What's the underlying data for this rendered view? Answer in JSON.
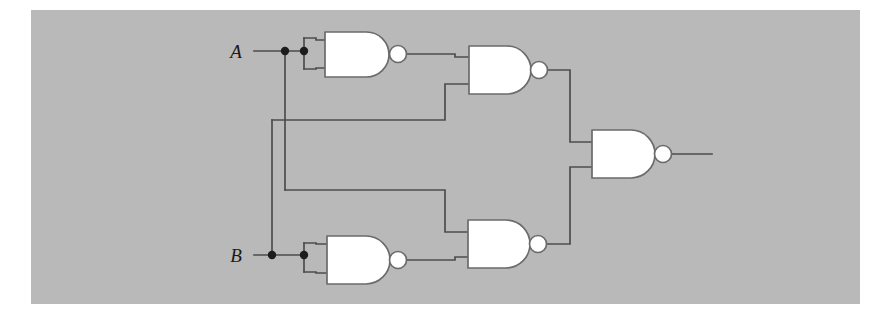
{
  "figure": {
    "kind": "logic-circuit-diagram",
    "panel": {
      "background_color": "#b9b9b9",
      "page_color": "#ffffff",
      "x": 31,
      "y": 10,
      "width": 829,
      "height": 294
    },
    "wire_color": "#4d4d4d",
    "gate_fill_color": "#ffffff",
    "gate_outline_color": "#6b6b6b",
    "junction_color": "#1d1d1d"
  },
  "inputs": [
    {
      "id": "input-a",
      "label": "A",
      "label_x": 236,
      "label_y": 58,
      "wire_y": 51
    },
    {
      "id": "input-b",
      "label": "B",
      "label_x": 236,
      "label_y": 262,
      "wire_y": 255
    }
  ],
  "outputs": [
    {
      "id": "output-wire",
      "label": "",
      "x_start": 672,
      "x_end": 712,
      "y": 154
    }
  ],
  "gates": [
    {
      "id": "gate-1",
      "type": "NAND",
      "role": "inverter-a",
      "body_x": 325,
      "body_y": 32,
      "body_w": 64,
      "body_h": 45,
      "bubble_cx": 398,
      "bubble_cy": 54,
      "bubble_r": 8.5
    },
    {
      "id": "gate-2",
      "type": "NAND",
      "role": "upper-combine",
      "body_x": 469,
      "body_y": 46,
      "body_w": 62,
      "body_h": 48,
      "bubble_cx": 539,
      "bubble_cy": 70,
      "bubble_r": 8.5
    },
    {
      "id": "gate-3",
      "type": "NAND",
      "role": "output",
      "body_x": 592,
      "body_y": 130,
      "body_w": 63,
      "body_h": 48,
      "bubble_cx": 663,
      "bubble_cy": 154,
      "bubble_r": 8.5
    },
    {
      "id": "gate-4",
      "type": "NAND",
      "role": "inverter-b",
      "body_x": 327,
      "body_y": 236,
      "body_w": 63,
      "body_h": 48,
      "bubble_cx": 398,
      "bubble_cy": 260,
      "bubble_r": 8.5
    },
    {
      "id": "gate-5",
      "type": "NAND",
      "role": "lower-combine",
      "body_x": 468,
      "body_y": 220,
      "body_w": 62,
      "body_h": 48,
      "bubble_cx": 538,
      "bubble_cy": 244,
      "bubble_r": 8.5
    }
  ],
  "junctions": [
    {
      "id": "junction-a-branch",
      "cx": 285,
      "cy": 51,
      "r": 4.2
    },
    {
      "id": "junction-a-gate-tie",
      "cx": 304,
      "cy": 51,
      "r": 4.2
    },
    {
      "id": "junction-b-branch",
      "cx": 272,
      "cy": 255,
      "r": 4.2
    },
    {
      "id": "junction-b-gate-tie",
      "cx": 304,
      "cy": 255,
      "r": 4.2
    }
  ],
  "wires": [
    {
      "id": "wire-a-input",
      "points": "254,51 304,51"
    },
    {
      "id": "wire-a-gate1-top",
      "points": "304,38 316,38 316,40 325,40"
    },
    {
      "id": "wire-a-gate1-bottom",
      "points": "304,69 316,69 316,68 325,68"
    },
    {
      "id": "wire-a-tie-vertical",
      "points": "304,38 304,69"
    },
    {
      "id": "wire-a-down-to-b",
      "points": "285,51 285,190"
    },
    {
      "id": "wire-a-to-gate5-top",
      "points": "285,190 445,190 445,232 468,232"
    },
    {
      "id": "wire-b-input",
      "points": "254,255 304,255"
    },
    {
      "id": "wire-b-gate4-top",
      "points": "304,243 316,243 316,244 327,244"
    },
    {
      "id": "wire-b-gate4-bottom",
      "points": "304,272 316,272 316,273 327,273"
    },
    {
      "id": "wire-b-tie-vertical",
      "points": "304,243 304,272"
    },
    {
      "id": "wire-b-up-to-a",
      "points": "272,255 272,120"
    },
    {
      "id": "wire-b-to-gate2-bottom",
      "points": "272,120 445,120 445,84 469,84"
    },
    {
      "id": "wire-gate1-out-to-gate2-top",
      "points": "407,54 455,54 455,57 469,57"
    },
    {
      "id": "wire-gate4-out-to-gate5-bottom",
      "points": "407,260 455,260 455,257 468,257"
    },
    {
      "id": "wire-gate2-out-to-output-top",
      "points": "548,70 570,70 570,142 592,142"
    },
    {
      "id": "wire-gate5-out-to-output-bottom",
      "points": "547,244 570,244 570,167 592,167"
    },
    {
      "id": "wire-output",
      "points": "672,154 712,154"
    }
  ],
  "logic": {
    "description": "Exclusive-OR built from five NAND gates",
    "gate_count": 5,
    "input_count": 2,
    "output_count": 1
  }
}
